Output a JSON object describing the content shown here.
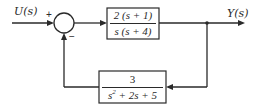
{
  "diagram": {
    "type": "feedback-control-block-diagram",
    "input": {
      "label": "U(s)"
    },
    "output": {
      "label": "Y(s)"
    },
    "summing_junction": {
      "signs": {
        "reference": "+",
        "feedback": "−"
      }
    },
    "forward_block": {
      "numerator": "2 (s + 1)",
      "denominator": "s (s + 4)"
    },
    "feedback_block": {
      "numerator": "3",
      "denominator_parts": [
        "s",
        "2",
        " + 2s + 5"
      ]
    },
    "colors": {
      "stroke": "#2a2a2a",
      "background": "#ffffff"
    }
  }
}
